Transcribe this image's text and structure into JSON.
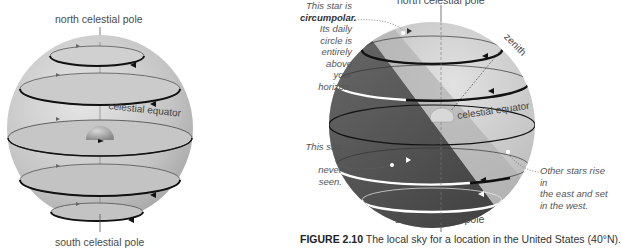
{
  "left_figure": {
    "top_label": "north celestial pole",
    "equator_label": "celestial equator",
    "bottom_label": "south celestial pole"
  },
  "right_figure": {
    "top_label": "north celestial pole",
    "zenith_label": "zenith",
    "equator_label": "celestial equator",
    "bottom_label": "south celestial pole",
    "notes": {
      "circumpolar": {
        "line1": "This star is",
        "line2_bold": "circumpolar.",
        "line3": "Its daily circle is",
        "line4": "entirely above",
        "line5": "your horizon."
      },
      "never_seen": {
        "line1": "This star is",
        "line2": "never seen."
      },
      "rise_set": {
        "line1": "Other stars rise in",
        "line2": "the east and set",
        "line3": "in the west."
      }
    }
  },
  "caption": {
    "figure_number": "FIGURE 2.10",
    "text": " The local sky for a location in the United States (40°N)."
  },
  "colors": {
    "sphere": "#c8c8c8",
    "sphere_dark": "#8a8a8a",
    "below_horizon": "#555555",
    "star_path_dark": "#1a1a1a",
    "star_path_white": "#ffffff"
  }
}
